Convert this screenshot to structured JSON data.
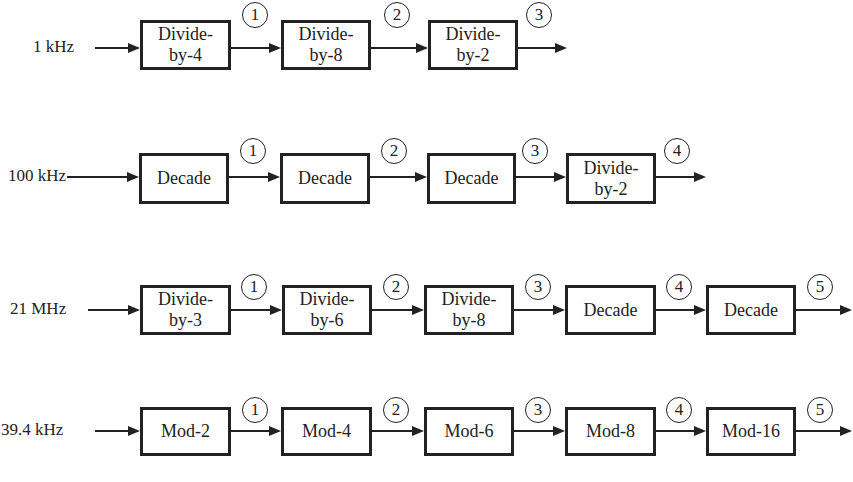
{
  "diagram": {
    "rows": [
      {
        "input": "1 kHz",
        "blocks": [
          {
            "line1": "Divide-",
            "line2": "by-4"
          },
          {
            "line1": "Divide-",
            "line2": "by-8"
          },
          {
            "line1": "Divide-",
            "line2": "by-2"
          }
        ],
        "nodes": [
          "1",
          "2",
          "3"
        ]
      },
      {
        "input": "100 kHz",
        "blocks": [
          {
            "line1": "Decade",
            "line2": ""
          },
          {
            "line1": "Decade",
            "line2": ""
          },
          {
            "line1": "Decade",
            "line2": ""
          },
          {
            "line1": "Divide-",
            "line2": "by-2"
          }
        ],
        "nodes": [
          "1",
          "2",
          "3",
          "4"
        ]
      },
      {
        "input": "21 MHz",
        "blocks": [
          {
            "line1": "Divide-",
            "line2": "by-3"
          },
          {
            "line1": "Divide-",
            "line2": "by-6"
          },
          {
            "line1": "Divide-",
            "line2": "by-8"
          },
          {
            "line1": "Decade",
            "line2": ""
          },
          {
            "line1": "Decade",
            "line2": ""
          }
        ],
        "nodes": [
          "1",
          "2",
          "3",
          "4",
          "5"
        ]
      },
      {
        "input": "39.4 kHz",
        "blocks": [
          {
            "line1": "Mod-2",
            "line2": ""
          },
          {
            "line1": "Mod-4",
            "line2": ""
          },
          {
            "line1": "Mod-6",
            "line2": ""
          },
          {
            "line1": "Mod-8",
            "line2": ""
          },
          {
            "line1": "Mod-16",
            "line2": ""
          }
        ],
        "nodes": [
          "1",
          "2",
          "3",
          "4",
          "5"
        ]
      }
    ]
  }
}
